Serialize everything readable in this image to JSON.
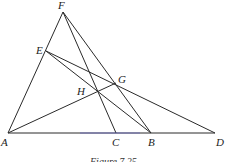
{
  "figure": {
    "caption": "Figure 7.25",
    "points": {
      "A": "A",
      "B": "B",
      "C": "C",
      "D": "D",
      "E": "E",
      "F": "F",
      "G": "G",
      "H": "H"
    },
    "segments": [
      "FA",
      "FC",
      "FB",
      "ED",
      "EB",
      "AG",
      "AD"
    ],
    "colors": {
      "line": "#2a2a2a",
      "base_highlight": "#5a5ad0"
    }
  }
}
